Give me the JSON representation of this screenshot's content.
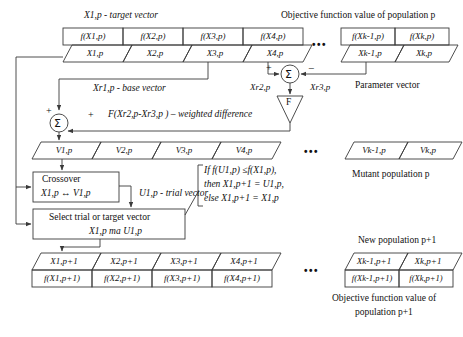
{
  "figure": {
    "language_note": "та"
  },
  "labels": {
    "target_vector": "X1,p - target vector",
    "objective_top": "Objective function value of population p",
    "base_vector": "Xr1,p - base vector",
    "weighted_difference": "F(Xr2,p-Xr3,p ) – weighted difference",
    "parameter_vector": "Parameter vector",
    "mutant_population": "Mutant population p",
    "trial_vector": "U1,p  - trial vector",
    "new_population": "New population p+1",
    "objective_bottom_line1": "Objective function value of",
    "objective_bottom_line2": "population p+1",
    "xr2": "Xr2,p",
    "xr3": "Xr3,p",
    "plus1": "+",
    "plus2": "+",
    "plus3": "+",
    "minus1": "−",
    "sigma": "Σ",
    "F": "F",
    "ellipsis": "•••"
  },
  "boxes": {
    "crossover": {
      "line1": "Crossover",
      "line2": "X1,p ↔ V1,p"
    },
    "select": {
      "line1": "Select trial or target vector",
      "line2": "X1,p та U1,p"
    },
    "condition": {
      "line1": "If f(U1,p) ≤f(X1,p),",
      "line2": "then X1,p+1 = U1,p,",
      "line3": "else X1,p+1 = X1,p"
    }
  },
  "rows": {
    "target_population": {
      "fitness_cells": [
        "f(X1,p)",
        "f(X2,p)",
        "f(X3,p)",
        "f(X4,p)"
      ],
      "vector_cells": [
        "X1,p",
        "X2,p",
        "X3,p",
        "X4,p"
      ],
      "tail_fitness_cells": [
        "f(Xk-1,p)",
        "f(Xk,p)"
      ],
      "tail_vector_cells": [
        "Xk-1,p",
        "Xk,p"
      ]
    },
    "mutant_population": {
      "cells": [
        "V1,p",
        "V2,p",
        "V3,p",
        "V4,p"
      ],
      "tail_cells": [
        "Vk-1,p",
        "Vk,p"
      ]
    },
    "new_population": {
      "vector_cells": [
        "X1,p+1",
        "X2,p+1",
        "X3,p+1",
        "X4,p+1"
      ],
      "fitness_cells": [
        "f(X1,p+1)",
        "f(X2,p+1)",
        "f(X3,p+1)",
        "f(X4,p+1)"
      ],
      "tail_vector_cells": [
        "Xk-1,p+1",
        "Xk,p+1"
      ],
      "tail_fitness_cells": [
        "f(Xk-1,p+1)",
        "f(Xk,p+1)"
      ]
    }
  },
  "colors": {
    "stroke": "#3a3a3a",
    "text": "#111111",
    "background": "#ffffff"
  }
}
